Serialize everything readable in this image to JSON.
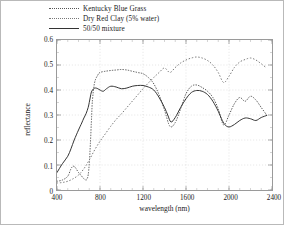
{
  "chart_data": {
    "type": "line",
    "title": "",
    "xlabel": "wavelength (nm)",
    "ylabel": "reflectance",
    "xlim": [
      400,
      2400
    ],
    "ylim": [
      0,
      0.6
    ],
    "xticks": [
      "400",
      "800",
      "1200",
      "1600",
      "2000",
      "2400"
    ],
    "xtick_values": [
      400,
      800,
      1200,
      1600,
      2000,
      2400
    ],
    "yticks": [
      "0",
      "0.1",
      "0.2",
      "0.3",
      "0.4",
      "0.5",
      "0.6"
    ],
    "ytick_values": [
      0,
      0.1,
      0.2,
      0.3,
      0.4,
      0.5,
      0.6
    ],
    "grid": true,
    "legend_position": "above-plot-left",
    "series": [
      {
        "name": "Kentucky Blue Grass",
        "style": "dotted",
        "color": "#555555",
        "x": [
          400,
          450,
          500,
          530,
          550,
          570,
          600,
          630,
          650,
          670,
          680,
          690,
          700,
          710,
          720,
          730,
          750,
          780,
          800,
          850,
          900,
          950,
          1000,
          1050,
          1100,
          1150,
          1200,
          1250,
          1300,
          1350,
          1400,
          1450,
          1500,
          1550,
          1600,
          1650,
          1700,
          1750,
          1800,
          1850,
          1900,
          1950,
          2000,
          2050,
          2100,
          2150,
          2200,
          2250,
          2300,
          2350
        ],
        "y": [
          0.035,
          0.04,
          0.055,
          0.085,
          0.095,
          0.09,
          0.07,
          0.055,
          0.045,
          0.04,
          0.045,
          0.06,
          0.105,
          0.18,
          0.275,
          0.36,
          0.43,
          0.46,
          0.47,
          0.475,
          0.478,
          0.48,
          0.482,
          0.48,
          0.475,
          0.47,
          0.465,
          0.45,
          0.425,
          0.38,
          0.32,
          0.255,
          0.27,
          0.325,
          0.385,
          0.415,
          0.42,
          0.41,
          0.395,
          0.37,
          0.325,
          0.26,
          0.3,
          0.345,
          0.37,
          0.355,
          0.375,
          0.36,
          0.33,
          0.3
        ]
      },
      {
        "name": "Dry Red Clay (5% water)",
        "style": "dotted",
        "color": "#777777",
        "x": [
          400,
          450,
          500,
          550,
          600,
          650,
          700,
          750,
          800,
          850,
          900,
          950,
          1000,
          1050,
          1100,
          1150,
          1200,
          1250,
          1300,
          1350,
          1400,
          1450,
          1500,
          1550,
          1600,
          1650,
          1700,
          1750,
          1800,
          1850,
          1900,
          1950,
          2000,
          2050,
          2100,
          2150,
          2200,
          2250,
          2300,
          2350
        ],
        "y": [
          0.028,
          0.03,
          0.035,
          0.045,
          0.06,
          0.085,
          0.12,
          0.16,
          0.195,
          0.225,
          0.255,
          0.282,
          0.305,
          0.33,
          0.355,
          0.38,
          0.405,
          0.428,
          0.45,
          0.47,
          0.488,
          0.47,
          0.49,
          0.508,
          0.52,
          0.528,
          0.532,
          0.528,
          0.518,
          0.5,
          0.47,
          0.43,
          0.455,
          0.49,
          0.512,
          0.522,
          0.528,
          0.52,
          0.505,
          0.488
        ]
      },
      {
        "name": "50/50 mixture",
        "style": "solid",
        "color": "#333333",
        "x": [
          400,
          450,
          500,
          530,
          560,
          600,
          630,
          650,
          670,
          690,
          700,
          710,
          720,
          740,
          760,
          780,
          800,
          830,
          860,
          900,
          950,
          1000,
          1050,
          1100,
          1150,
          1200,
          1250,
          1300,
          1350,
          1400,
          1430,
          1460,
          1500,
          1550,
          1600,
          1650,
          1700,
          1750,
          1800,
          1850,
          1900,
          1930,
          1960,
          2000,
          2050,
          2100,
          2150,
          2200,
          2250,
          2300,
          2350
        ],
        "y": [
          0.07,
          0.105,
          0.135,
          0.165,
          0.2,
          0.24,
          0.268,
          0.288,
          0.305,
          0.33,
          0.35,
          0.372,
          0.392,
          0.405,
          0.408,
          0.405,
          0.4,
          0.395,
          0.405,
          0.415,
          0.412,
          0.405,
          0.408,
          0.415,
          0.418,
          0.418,
          0.412,
          0.4,
          0.37,
          0.33,
          0.3,
          0.272,
          0.29,
          0.33,
          0.365,
          0.39,
          0.398,
          0.395,
          0.382,
          0.355,
          0.315,
          0.285,
          0.262,
          0.252,
          0.262,
          0.278,
          0.288,
          0.285,
          0.278,
          0.29,
          0.298
        ]
      }
    ]
  },
  "legend": {
    "items": [
      {
        "label": "Kentucky Blue Grass"
      },
      {
        "label": "Dry Red Clay (5% water)"
      },
      {
        "label": "50/50 mixture"
      }
    ]
  },
  "axes": {
    "x_title": "wavelength (nm)",
    "y_title": "reflectance"
  }
}
